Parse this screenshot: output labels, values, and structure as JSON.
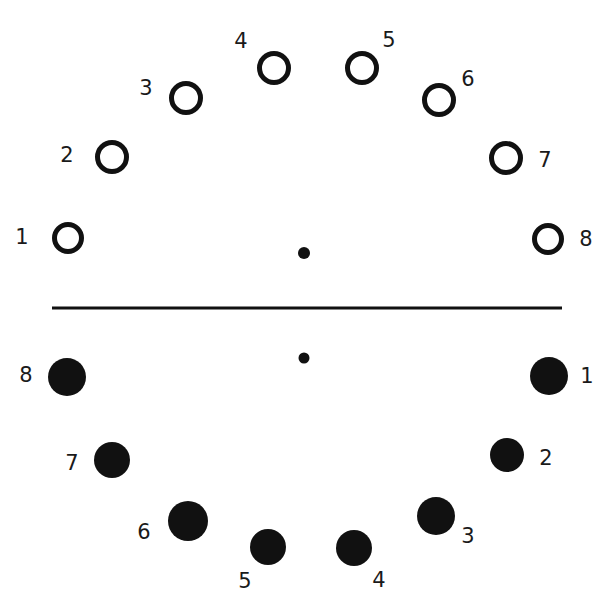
{
  "figure": {
    "title": "",
    "width": 612,
    "height": 615,
    "background_color": "#ffffff",
    "ink_color": "#111111",
    "label_color": "#1a1a1a"
  },
  "divider": {
    "name": "horizontal-divider-line",
    "x1": 52,
    "x2": 562,
    "y": 308,
    "thickness": 3,
    "color": "#111111"
  },
  "center_dots": [
    {
      "id": "upper-center-dot",
      "cx": 304,
      "cy": 253,
      "r": 6,
      "color": "#111111",
      "label": ""
    },
    {
      "id": "lower-center-dot",
      "cx": 304,
      "cy": 358,
      "r": 5.5,
      "color": "#111111",
      "label": ""
    }
  ],
  "chart_data": {
    "type": "scatter",
    "title": "",
    "subtitle": "",
    "xlabel": "",
    "ylabel": "",
    "xlim": [
      0,
      612
    ],
    "ylim": [
      615,
      0
    ],
    "grid": false,
    "legend": "none",
    "annotations": [],
    "series": [
      {
        "name": "upper-arc-open-circles",
        "marker": "open-circle",
        "marker_color": "#111111",
        "marker_fill": "none",
        "stroke_width": 5,
        "points": [
          {
            "label": "1",
            "cx": 68,
            "cy": 238,
            "r": 16,
            "label_x": 22,
            "label_y": 238
          },
          {
            "label": "2",
            "cx": 112,
            "cy": 157,
            "r": 17,
            "label_x": 67,
            "label_y": 156
          },
          {
            "label": "3",
            "cx": 186,
            "cy": 98,
            "r": 17,
            "label_x": 146,
            "label_y": 89
          },
          {
            "label": "4",
            "cx": 274,
            "cy": 68,
            "r": 17,
            "label_x": 241,
            "label_y": 42
          },
          {
            "label": "5",
            "cx": 362,
            "cy": 68,
            "r": 17,
            "label_x": 389,
            "label_y": 41
          },
          {
            "label": "6",
            "cx": 439,
            "cy": 100,
            "r": 17,
            "label_x": 468,
            "label_y": 80
          },
          {
            "label": "7",
            "cx": 506,
            "cy": 158,
            "r": 17,
            "label_x": 545,
            "label_y": 161
          },
          {
            "label": "8",
            "cx": 548,
            "cy": 239,
            "r": 16,
            "label_x": 586,
            "label_y": 240
          }
        ]
      },
      {
        "name": "lower-arc-filled-circles",
        "marker": "filled-circle",
        "marker_color": "#111111",
        "marker_fill": "#111111",
        "stroke_width": 0,
        "points": [
          {
            "label": "1",
            "cx": 549,
            "cy": 376,
            "r": 19,
            "label_x": 587,
            "label_y": 377
          },
          {
            "label": "2",
            "cx": 507,
            "cy": 455,
            "r": 17,
            "label_x": 546,
            "label_y": 459
          },
          {
            "label": "3",
            "cx": 436,
            "cy": 516,
            "r": 19,
            "label_x": 468,
            "label_y": 537
          },
          {
            "label": "4",
            "cx": 354,
            "cy": 548,
            "r": 18,
            "label_x": 379,
            "label_y": 581
          },
          {
            "label": "5",
            "cx": 268,
            "cy": 547,
            "r": 18,
            "label_x": 245,
            "label_y": 582
          },
          {
            "label": "6",
            "cx": 188,
            "cy": 521,
            "r": 20,
            "label_x": 144,
            "label_y": 533
          },
          {
            "label": "7",
            "cx": 112,
            "cy": 460,
            "r": 18,
            "label_x": 72,
            "label_y": 464
          },
          {
            "label": "8",
            "cx": 67,
            "cy": 377,
            "r": 19,
            "label_x": 26,
            "label_y": 376
          }
        ]
      }
    ]
  }
}
